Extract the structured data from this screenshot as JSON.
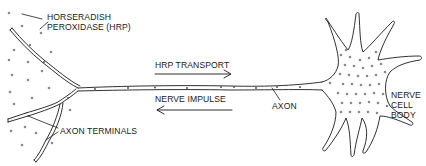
{
  "figure": {
    "colors": {
      "ink": "#1a1a1a",
      "dot": "#8a8a8a",
      "background": "#ffffff"
    }
  },
  "labels": {
    "hrp_line1": "HORSERADISH",
    "hrp_line2": "PEROXIDASE (HRP)",
    "hrp_transport": "HRP TRANSPORT",
    "nerve_impulse": "NERVE IMPULSE",
    "axon": "AXON",
    "axon_terminals": "AXON TERMINALS",
    "cell_body_line1": "NERVE",
    "cell_body_line2": "CELL",
    "cell_body_line3": "BODY"
  },
  "arrows": {
    "hrp_transport_direction": "right",
    "nerve_impulse_direction": "left"
  }
}
